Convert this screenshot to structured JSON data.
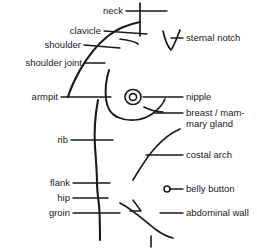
{
  "figure": {
    "type": "labeled-anatomical-diagram",
    "background_color": "#ffffff",
    "line_color": "#1a1a1a",
    "text_color": "#1a1a1a"
  },
  "labels_left": [
    {
      "id": "neck",
      "text": "neck"
    },
    {
      "id": "clavicle",
      "text": "clavicle"
    },
    {
      "id": "shoulder",
      "text": "shoulder"
    },
    {
      "id": "shoulder-joint",
      "text": "shoulder joint"
    },
    {
      "id": "armpit",
      "text": "armpit"
    },
    {
      "id": "rib",
      "text": "rib"
    },
    {
      "id": "flank",
      "text": "flank"
    },
    {
      "id": "hip",
      "text": "hip"
    },
    {
      "id": "groin",
      "text": "groin"
    }
  ],
  "labels_right": [
    {
      "id": "sternal-notch",
      "text": "sternal notch"
    },
    {
      "id": "nipple",
      "text": "nipple"
    },
    {
      "id": "breast",
      "text": "breast / mam-\nmary gland"
    },
    {
      "id": "costal-arch",
      "text": "costal arch"
    },
    {
      "id": "belly-button",
      "text": "belly button"
    },
    {
      "id": "abdominal-wall",
      "text": "abdominal wall"
    }
  ],
  "markers": [
    {
      "id": "nipple-marker",
      "shape": "concentric-circles"
    },
    {
      "id": "belly-button-marker",
      "shape": "small-open-circle"
    }
  ]
}
